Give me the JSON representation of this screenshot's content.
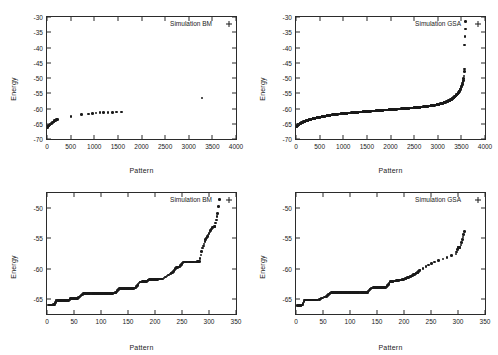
{
  "figure": {
    "panels": [
      {
        "id": "top-left",
        "legend": "Simulation BM",
        "xlabel": "Pattern",
        "ylabel": "Energy",
        "xticks": [
          "0",
          "500",
          "1000",
          "1500",
          "2000",
          "2500",
          "3000",
          "3500",
          "4000"
        ],
        "yticks": [
          "-30",
          "-35",
          "-40",
          "-45",
          "-50",
          "-55",
          "-60",
          "-65",
          "-70"
        ]
      },
      {
        "id": "top-right",
        "legend": "Simulation GSA",
        "xlabel": "Pattern",
        "ylabel": "Energy",
        "xticks": [
          "0",
          "500",
          "1000",
          "1500",
          "2000",
          "2500",
          "3000",
          "3500",
          "4000"
        ],
        "yticks": [
          "-30",
          "-35",
          "-40",
          "-45",
          "-50",
          "-55",
          "-60",
          "-65",
          "-70"
        ]
      },
      {
        "id": "bottom-left",
        "legend": "Simulation BM",
        "xlabel": "Pattern",
        "ylabel": "Energy",
        "xticks": [
          "0",
          "50",
          "100",
          "150",
          "200",
          "250",
          "300",
          "350"
        ],
        "yticks": [
          "-50",
          "-55",
          "-60",
          "-65"
        ]
      },
      {
        "id": "bottom-right",
        "legend": "Simulation GSA",
        "xlabel": "Pattern",
        "ylabel": "Energy",
        "xticks": [
          "0",
          "50",
          "100",
          "150",
          "200",
          "250",
          "300",
          "350"
        ],
        "yticks": [
          "-50",
          "-55",
          "-60",
          "-65"
        ]
      }
    ]
  },
  "chart_data": [
    {
      "type": "scatter",
      "title": "",
      "legend": [
        "Simulation BM"
      ],
      "legend_position": "top-right",
      "xlabel": "Pattern",
      "ylabel": "Energy",
      "xlim": [
        0,
        4000
      ],
      "ylim": [
        -70,
        -30
      ],
      "xticks": [
        0,
        500,
        1000,
        1500,
        2000,
        2500,
        3000,
        3500,
        4000
      ],
      "yticks": [
        -70,
        -65,
        -60,
        -55,
        -50,
        -45,
        -40,
        -35,
        -30
      ],
      "grid": false,
      "marker": "plus",
      "color": "#1a1a1a",
      "x": [
        5,
        12,
        20,
        28,
        36,
        45,
        55,
        66,
        78,
        90,
        103,
        118,
        134,
        150,
        160,
        168,
        175,
        182,
        190,
        196,
        202,
        208,
        214,
        220,
        505,
        735,
        880,
        960,
        1040,
        1120,
        1200,
        1290,
        1380,
        1470,
        1580,
        3280
      ],
      "y": [
        -66.2,
        -66.0,
        -65.9,
        -65.8,
        -65.6,
        -65.5,
        -65.4,
        -65.2,
        -65.1,
        -65.0,
        -64.8,
        -64.6,
        -64.4,
        -64.2,
        -64.0,
        -63.9,
        -63.85,
        -63.8,
        -63.8,
        -63.75,
        -63.7,
        -63.7,
        -63.65,
        -63.6,
        -62.6,
        -62.0,
        -61.8,
        -61.6,
        -61.5,
        -61.4,
        -61.35,
        -61.3,
        -61.25,
        -61.2,
        -61.1,
        -56.5
      ]
    },
    {
      "type": "scatter",
      "title": "",
      "legend": [
        "Simulation GSA"
      ],
      "legend_position": "top-right",
      "xlabel": "Pattern",
      "ylabel": "Energy",
      "xlim": [
        0,
        4000
      ],
      "ylim": [
        -70,
        -30
      ],
      "xticks": [
        0,
        500,
        1000,
        1500,
        2000,
        2500,
        3000,
        3500,
        4000
      ],
      "yticks": [
        -70,
        -65,
        -60,
        -55,
        -50,
        -45,
        -40,
        -35,
        -30
      ],
      "grid": false,
      "marker": "plus",
      "color": "#1a1a1a",
      "description": "Dense monotonically increasing S-curve of ~3550 sorted energies rising from -66 at x=0 to about -55 near x=3450, then rising steeply to -47 near x=3560, with isolated outliers at about -39, -36 and -31.5 near x=3570-3600.",
      "x": [
        0,
        40,
        90,
        150,
        220,
        300,
        400,
        520,
        650,
        800,
        980,
        1180,
        1400,
        1650,
        1900,
        2150,
        2400,
        2620,
        2820,
        2980,
        3100,
        3200,
        3280,
        3340,
        3390,
        3430,
        3465,
        3495,
        3520,
        3540,
        3552,
        3560,
        3566,
        3572,
        3580,
        3592
      ],
      "y": [
        -66.1,
        -65.4,
        -64.9,
        -64.4,
        -64.0,
        -63.6,
        -63.2,
        -62.8,
        -62.4,
        -62.0,
        -61.7,
        -61.4,
        -61.1,
        -60.8,
        -60.5,
        -60.2,
        -59.9,
        -59.6,
        -59.2,
        -58.8,
        -58.3,
        -57.7,
        -57.1,
        -56.4,
        -55.7,
        -55.0,
        -54.2,
        -53.2,
        -52.1,
        -50.8,
        -49.4,
        -47.8,
        -47.0,
        -39.2,
        -36.3,
        -31.5
      ]
    },
    {
      "type": "scatter",
      "title": "",
      "legend": [
        "Simulation BM"
      ],
      "legend_position": "top-right",
      "xlabel": "Pattern",
      "ylabel": "Energy",
      "xlim": [
        0,
        350
      ],
      "ylim": [
        -67.5,
        -47.5
      ],
      "xticks": [
        0,
        50,
        100,
        150,
        200,
        250,
        300,
        350
      ],
      "yticks": [
        -65,
        -60,
        -55,
        -50
      ],
      "grid": false,
      "marker": "plus",
      "color": "#1a1a1a",
      "description": "Staircase of ~320 sorted energy levels; flat plateaus separated by jumps, rising from -66 to about -48.5.",
      "x": [
        2,
        5,
        8,
        11,
        14,
        17,
        20,
        24,
        28,
        32,
        36,
        40,
        44,
        48,
        52,
        56,
        68,
        74,
        80,
        86,
        92,
        98,
        104,
        110,
        116,
        122,
        128,
        134,
        140,
        146,
        152,
        158,
        164,
        172,
        176,
        180,
        184,
        190,
        196,
        202,
        208,
        214,
        228,
        234,
        240,
        246,
        252,
        258,
        266,
        274,
        282,
        288,
        294,
        300,
        306,
        311,
        316,
        319
      ],
      "y": [
        -66.0,
        -66.0,
        -66.0,
        -66.0,
        -65.9,
        -65.3,
        -65.3,
        -65.3,
        -65.3,
        -65.3,
        -65.3,
        -65.3,
        -64.9,
        -64.9,
        -64.9,
        -64.9,
        -64.1,
        -64.1,
        -64.1,
        -64.1,
        -64.1,
        -64.1,
        -64.1,
        -64.1,
        -64.1,
        -64.1,
        -63.9,
        -63.3,
        -63.3,
        -63.3,
        -63.3,
        -63.3,
        -63.2,
        -62.2,
        -62.2,
        -62.1,
        -62.1,
        -61.8,
        -61.8,
        -61.8,
        -61.7,
        -61.7,
        -60.9,
        -60.5,
        -59.8,
        -59.7,
        -58.9,
        -58.9,
        -58.9,
        -58.9,
        -58.85,
        -56.6,
        -55.2,
        -54.2,
        -53.2,
        -53.0,
        -50.9,
        -48.6
      ]
    },
    {
      "type": "scatter",
      "title": "",
      "legend": [
        "Simulation GSA"
      ],
      "legend_position": "top-right",
      "xlabel": "Pattern",
      "ylabel": "Energy",
      "xlim": [
        0,
        350
      ],
      "ylim": [
        -67.5,
        -47.5
      ],
      "xticks": [
        0,
        50,
        100,
        150,
        200,
        250,
        300,
        350
      ],
      "yticks": [
        -65,
        -60,
        -55,
        -50
      ],
      "grid": false,
      "marker": "plus",
      "color": "#1a1a1a",
      "description": "Staircase of ~315 sorted energy levels rising from -66 to about -53.9, with a long plateau near -65 and sparse high outliers beyond x=250.",
      "x": [
        2,
        5,
        8,
        12,
        16,
        20,
        24,
        28,
        32,
        36,
        40,
        56,
        60,
        64,
        68,
        72,
        78,
        84,
        90,
        96,
        102,
        108,
        114,
        120,
        126,
        132,
        140,
        146,
        152,
        158,
        164,
        168,
        174,
        180,
        186,
        192,
        198,
        204,
        210,
        214,
        218,
        222,
        226,
        230,
        256,
        296,
        300,
        304,
        308,
        312
      ],
      "y": [
        -66.1,
        -66.1,
        -66.1,
        -66.0,
        -65.2,
        -65.2,
        -65.2,
        -65.2,
        -65.2,
        -65.2,
        -65.2,
        -64.6,
        -64.3,
        -64.0,
        -63.9,
        -63.9,
        -63.9,
        -63.9,
        -63.9,
        -63.9,
        -63.9,
        -63.9,
        -63.9,
        -63.9,
        -63.9,
        -63.9,
        -63.2,
        -63.1,
        -63.1,
        -63.1,
        -63.1,
        -63.05,
        -62.2,
        -62.1,
        -62.0,
        -61.9,
        -61.8,
        -61.6,
        -61.4,
        -61.2,
        -61.0,
        -60.8,
        -60.6,
        -60.2,
        -58.9,
        -57.6,
        -56.5,
        -56.5,
        -55.2,
        -53.9
      ]
    }
  ]
}
